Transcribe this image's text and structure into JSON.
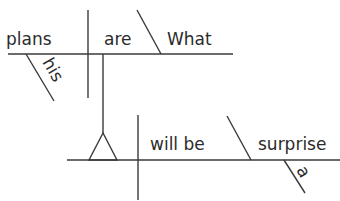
{
  "diagram": {
    "type": "sentence-diagram",
    "sentence": "What his plans are will be a surprise",
    "clause_main": {
      "subject_clause": {
        "subject": "plans",
        "verb": "are",
        "complement": "What",
        "modifier_of_subject": "his"
      },
      "verb": "will be",
      "predicate_nominative": "surprise",
      "modifier_of_complement": "a"
    },
    "colors": {
      "line": "#3a3a3a",
      "text": "#2b2b2b",
      "background": "#ffffff"
    }
  }
}
